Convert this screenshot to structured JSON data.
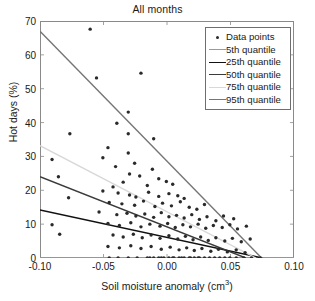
{
  "chart_data": {
    "type": "scatter",
    "title": "All months",
    "xlabel": "Soil moisture anomaly (cm3)",
    "xlabel_base": "Soil moisture anomaly (cm",
    "xlabel_sup": "3",
    "xlabel_tail": ")",
    "ylabel": "Hot days (%)",
    "xlim": [
      -0.1,
      0.1
    ],
    "ylim": [
      0,
      70
    ],
    "xticks": [
      -0.1,
      -0.05,
      0.0,
      0.05,
      0.1
    ],
    "xtick_labels": [
      "-0.10",
      "-0.05",
      "0.00",
      "0.05",
      "0.10"
    ],
    "yticks": [
      0,
      10,
      20,
      30,
      40,
      50,
      60,
      70
    ],
    "ytick_labels": [
      "0",
      "10",
      "20",
      "30",
      "40",
      "50",
      "60",
      "70"
    ],
    "grid": false,
    "legend_position": "top-right",
    "marker": {
      "shape": "circle",
      "color": "#2a2a2a",
      "size": 3.4
    },
    "series": [
      {
        "name": "Data points",
        "type": "scatter",
        "color": "#2a2a2a",
        "points": [
          [
            -0.0605,
            67.6
          ],
          [
            -0.0555,
            53.2
          ],
          [
            -0.0205,
            54.6
          ],
          [
            -0.0395,
            39.8
          ],
          [
            -0.0765,
            36.7
          ],
          [
            -0.0305,
            43.1
          ],
          [
            -0.0305,
            36.7
          ],
          [
            -0.0105,
            35.2
          ],
          [
            -0.0465,
            32.6
          ],
          [
            -0.0305,
            31.0
          ],
          [
            -0.0905,
            29.1
          ],
          [
            -0.0505,
            29.6
          ],
          [
            -0.0855,
            24.0
          ],
          [
            -0.0255,
            28.0
          ],
          [
            -0.0405,
            27.0
          ],
          [
            -0.0295,
            24.8
          ],
          [
            -0.0215,
            24.2
          ],
          [
            -0.0115,
            26.2
          ],
          [
            -0.0345,
            22.4
          ],
          [
            -0.0425,
            21.0
          ],
          [
            -0.0065,
            23.4
          ],
          [
            -0.0155,
            21.4
          ],
          [
            -0.0005,
            22.6
          ],
          [
            0.0045,
            21.8
          ],
          [
            -0.0505,
            19.8
          ],
          [
            -0.0385,
            19.2
          ],
          [
            -0.0295,
            18.6
          ],
          [
            -0.0245,
            18.0
          ],
          [
            -0.0145,
            19.4
          ],
          [
            -0.0065,
            18.2
          ],
          [
            0.0015,
            19.0
          ],
          [
            0.0085,
            18.4
          ],
          [
            0.0135,
            17.6
          ],
          [
            -0.0775,
            17.8
          ],
          [
            -0.0455,
            16.4
          ],
          [
            -0.0355,
            16.0
          ],
          [
            -0.0255,
            15.6
          ],
          [
            -0.0185,
            16.8
          ],
          [
            -0.0095,
            15.2
          ],
          [
            -0.0035,
            16.2
          ],
          [
            0.0035,
            15.4
          ],
          [
            0.0105,
            16.6
          ],
          [
            0.0175,
            15.0
          ],
          [
            0.0235,
            14.4
          ],
          [
            0.0295,
            15.8
          ],
          [
            -0.0905,
            9.8
          ],
          [
            -0.0845,
            7.0
          ],
          [
            -0.0535,
            13.6
          ],
          [
            -0.0395,
            12.8
          ],
          [
            -0.0315,
            13.2
          ],
          [
            -0.0245,
            12.4
          ],
          [
            -0.0175,
            13.0
          ],
          [
            -0.0105,
            12.0
          ],
          [
            -0.0045,
            13.4
          ],
          [
            0.0015,
            12.2
          ],
          [
            0.0075,
            12.6
          ],
          [
            0.0135,
            11.8
          ],
          [
            0.0195,
            12.8
          ],
          [
            0.0255,
            11.4
          ],
          [
            0.0315,
            12.2
          ],
          [
            0.0385,
            11.0
          ],
          [
            0.0445,
            12.4
          ],
          [
            0.0525,
            11.6
          ],
          [
            -0.0465,
            10.2
          ],
          [
            -0.0375,
            9.6
          ],
          [
            -0.0285,
            10.4
          ],
          [
            -0.0205,
            9.2
          ],
          [
            -0.0135,
            10.0
          ],
          [
            -0.0055,
            9.4
          ],
          [
            0.0005,
            10.2
          ],
          [
            0.0065,
            9.0
          ],
          [
            0.0125,
            9.8
          ],
          [
            0.0185,
            9.2
          ],
          [
            0.0245,
            10.0
          ],
          [
            0.0305,
            8.8
          ],
          [
            0.0365,
            9.6
          ],
          [
            0.0435,
            9.0
          ],
          [
            0.0495,
            9.8
          ],
          [
            0.0555,
            8.6
          ],
          [
            0.0625,
            9.4
          ],
          [
            -0.0425,
            6.8
          ],
          [
            -0.0345,
            6.2
          ],
          [
            -0.0265,
            7.0
          ],
          [
            -0.0195,
            6.0
          ],
          [
            -0.0125,
            6.8
          ],
          [
            -0.0055,
            5.8
          ],
          [
            0.0015,
            6.6
          ],
          [
            0.0085,
            5.6
          ],
          [
            0.0145,
            6.4
          ],
          [
            0.0205,
            5.4
          ],
          [
            0.0265,
            6.2
          ],
          [
            0.0325,
            5.2
          ],
          [
            0.0385,
            6.0
          ],
          [
            0.0455,
            5.0
          ],
          [
            0.0515,
            5.8
          ],
          [
            0.0585,
            4.8
          ],
          [
            0.0655,
            5.6
          ],
          [
            -0.0465,
            3.4
          ],
          [
            -0.0375,
            3.0
          ],
          [
            -0.0285,
            3.6
          ],
          [
            -0.0205,
            2.8
          ],
          [
            -0.0125,
            3.4
          ],
          [
            -0.0045,
            2.6
          ],
          [
            0.0025,
            3.2
          ],
          [
            0.0095,
            2.4
          ],
          [
            0.0155,
            3.0
          ],
          [
            0.0215,
            2.2
          ],
          [
            0.0275,
            2.8
          ],
          [
            0.0345,
            2.0
          ],
          [
            0.0405,
            2.6
          ],
          [
            0.0475,
            1.8
          ],
          [
            0.0545,
            2.4
          ],
          [
            0.0615,
            1.6
          ],
          [
            -0.0455,
            0.0
          ],
          [
            -0.0385,
            0.0
          ],
          [
            -0.0305,
            0.0
          ],
          [
            -0.0235,
            0.0
          ],
          [
            -0.0155,
            0.0
          ],
          [
            -0.0105,
            0.0
          ],
          [
            -0.0065,
            0.0
          ],
          [
            -0.0025,
            0.0
          ],
          [
            0.0015,
            0.0
          ],
          [
            0.0055,
            0.0
          ],
          [
            0.0095,
            0.0
          ],
          [
            0.0135,
            0.0
          ],
          [
            0.0175,
            0.0
          ],
          [
            0.0215,
            0.0
          ],
          [
            0.0255,
            0.0
          ],
          [
            0.0295,
            0.0
          ],
          [
            0.0335,
            0.0
          ],
          [
            0.0375,
            0.0
          ],
          [
            0.0415,
            0.0
          ],
          [
            0.0455,
            0.0
          ],
          [
            0.0495,
            0.0
          ],
          [
            0.0545,
            0.0
          ],
          [
            0.0605,
            0.0
          ],
          [
            0.0665,
            0.0
          ],
          [
            0.0735,
            0.0
          ],
          [
            0.0245,
            0.0
          ],
          [
            0.0185,
            0.0
          ],
          [
            0.0115,
            0.0
          ],
          [
            0.0045,
            0.0
          ],
          [
            -0.0045,
            0.0
          ],
          [
            -0.0135,
            0.0
          ]
        ]
      },
      {
        "name": "5th quantile",
        "type": "line",
        "color": "#9a9a9a",
        "endpoints": [
          [
            -0.1,
            0.0
          ],
          [
            0.1,
            0.0
          ]
        ]
      },
      {
        "name": "25th quantile",
        "type": "line",
        "color": "#111111",
        "endpoints": [
          [
            -0.1,
            14.2
          ],
          [
            0.075,
            0.0
          ]
        ]
      },
      {
        "name": "50th quantile",
        "type": "line",
        "color": "#3a3a3a",
        "endpoints": [
          [
            -0.1,
            24.0
          ],
          [
            0.062,
            0.0
          ]
        ]
      },
      {
        "name": "75th quantile",
        "type": "line",
        "color": "#d8d8d8",
        "endpoints": [
          [
            -0.1,
            33.2
          ],
          [
            0.07,
            0.0
          ]
        ]
      },
      {
        "name": "95th quantile",
        "type": "line",
        "color": "#757575",
        "endpoints": [
          [
            -0.1,
            67.0
          ],
          [
            0.0745,
            0.0
          ]
        ]
      }
    ]
  },
  "legend": {
    "entries": [
      {
        "label": "Data points",
        "key": "marker",
        "color": "#2a2a2a"
      },
      {
        "label": "5th quantile",
        "key": "line",
        "color": "#9a9a9a"
      },
      {
        "label": "25th quantile",
        "key": "line",
        "color": "#111111"
      },
      {
        "label": "50th quantile",
        "key": "line",
        "color": "#3a3a3a"
      },
      {
        "label": "75th quantile",
        "key": "line",
        "color": "#d8d8d8"
      },
      {
        "label": "95th quantile",
        "key": "line",
        "color": "#757575"
      }
    ]
  }
}
